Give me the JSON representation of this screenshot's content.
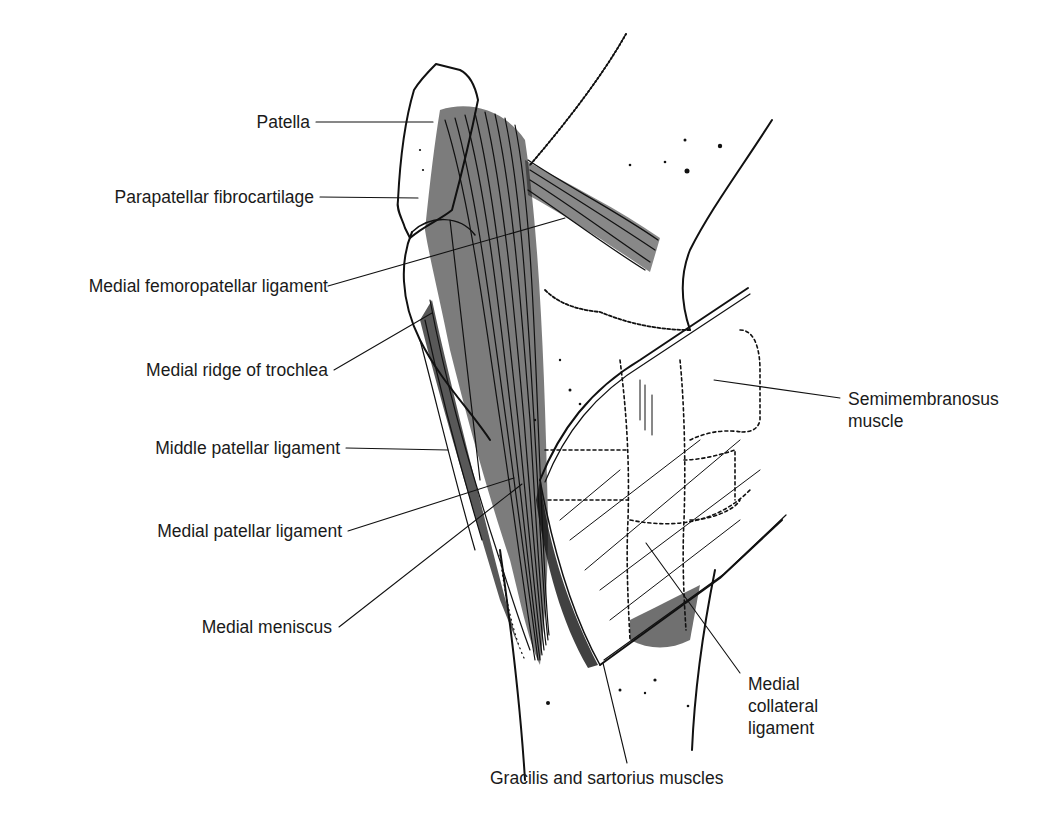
{
  "colors": {
    "ink": "#111111",
    "label": "#1a1a1a",
    "background": "#ffffff"
  },
  "labels": {
    "patella": "Patella",
    "parapatellar_fibrocartilage": "Parapatellar fibrocartilage",
    "medial_femoropatellar_ligament": "Medial femoropatellar ligament",
    "medial_ridge_of_trochlea": "Medial ridge of trochlea",
    "middle_patellar_ligament": "Middle patellar ligament",
    "medial_patellar_ligament": "Medial patellar ligament",
    "medial_meniscus": "Medial meniscus",
    "semimembranosus_muscle": {
      "line1": "Semimembranosus",
      "line2": "muscle"
    },
    "medial_collateral_ligament": {
      "line1": "Medial",
      "line2": "collateral",
      "line3": "ligament"
    },
    "gracilis_and_sartorius_muscles": "Gracilis and sartorius muscles"
  }
}
